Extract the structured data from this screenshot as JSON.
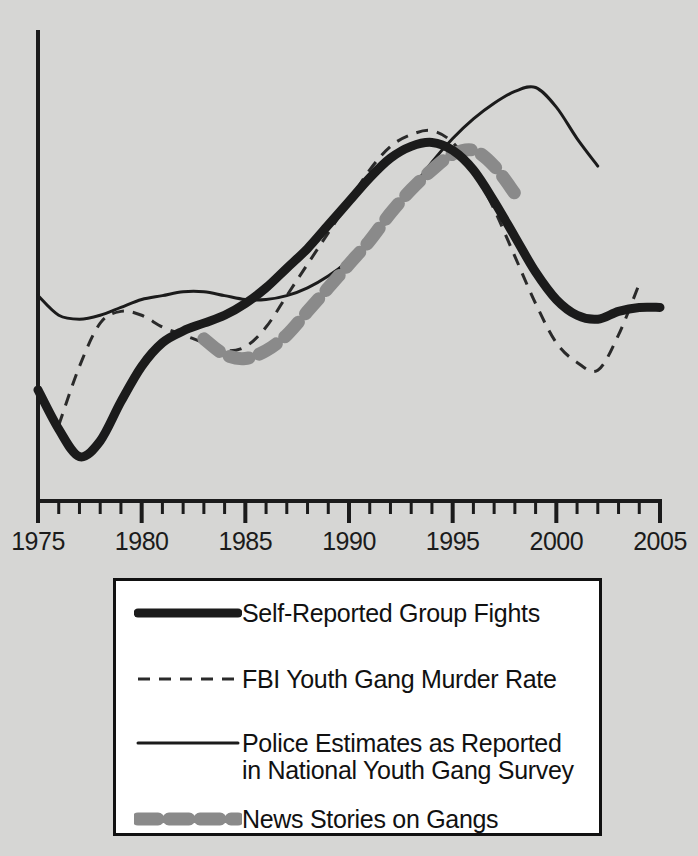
{
  "colors": {
    "background": "#d6d6d4",
    "axis": "#1b1b1b",
    "thick_black": "#1b1b1b",
    "thin_black": "#1b1b1b",
    "dashed_black": "#2a2a2a",
    "gray_dashed": "#8a8a8a",
    "legend_background": "#ffffff",
    "legend_border": "#111111"
  },
  "chart_data": {
    "type": "line",
    "title": "",
    "xlabel": "",
    "ylabel": "",
    "xlim": [
      1975,
      2005
    ],
    "ylim": [
      0,
      100
    ],
    "grid": false,
    "legend_position": "bottom",
    "x_tick_labels": [
      "1975",
      "1980",
      "1985",
      "1990",
      "1995",
      "2000",
      "2005"
    ],
    "x_major_ticks": [
      1975,
      1980,
      1985,
      1990,
      1995,
      2000,
      2005
    ],
    "x_minor_tick_interval": 1,
    "y_axis_ticks": [],
    "series": [
      {
        "name": "Self-Reported Group Fights",
        "style": "thick-solid",
        "color": "#1b1b1b",
        "x": [
          1975,
          1976,
          1977,
          1978,
          1979,
          1980,
          1981,
          1982,
          1983,
          1984,
          1985,
          1986,
          1987,
          1988,
          1989,
          1990,
          1991,
          1992,
          1993,
          1994,
          1995,
          1996,
          1997,
          1998,
          1999,
          2000,
          2001,
          2002,
          2003,
          2004,
          2005
        ],
        "values": [
          26,
          16,
          9,
          13,
          23,
          32,
          38,
          41,
          43,
          45,
          48,
          52,
          57,
          62,
          68,
          74,
          80,
          85,
          88,
          89,
          87,
          82,
          74,
          65,
          56,
          49,
          45,
          44,
          46,
          47,
          47
        ]
      },
      {
        "name": "FBI Youth Gang Murder Rate",
        "style": "thin-dashed",
        "color": "#2a2a2a",
        "x": [
          1976,
          1977,
          1978,
          1979,
          1980,
          1981,
          1982,
          1983,
          1984,
          1985,
          1986,
          1987,
          1988,
          1989,
          1990,
          1991,
          1992,
          1993,
          1994,
          1995,
          1996,
          1997,
          1998,
          1999,
          2000,
          2001,
          2002,
          2003,
          2004
        ],
        "values": [
          17,
          32,
          43,
          46,
          45,
          42,
          40,
          38,
          36,
          37,
          42,
          50,
          58,
          66,
          74,
          82,
          88,
          91,
          92,
          89,
          82,
          72,
          60,
          48,
          38,
          33,
          31,
          40,
          53
        ]
      },
      {
        "name": "Police Estimates as Reported in National Youth Gang Survey",
        "style": "thin-solid",
        "color": "#1b1b1b",
        "x": [
          1975,
          1976,
          1977,
          1978,
          1979,
          1980,
          1981,
          1982,
          1983,
          1984,
          1985,
          1986,
          1987,
          1988,
          1989,
          1990,
          1991,
          1992,
          1993,
          1994,
          1995,
          1996,
          1997,
          1998,
          1999,
          2000,
          2001,
          2002
        ],
        "values": [
          50,
          45,
          44,
          45,
          47,
          49,
          50,
          51,
          51,
          50,
          49,
          49,
          50,
          52,
          55,
          59,
          64,
          70,
          77,
          84,
          90,
          95,
          99,
          102,
          103,
          98,
          90,
          83
        ]
      },
      {
        "name": "News Stories on Gangs",
        "style": "thick-gray-dashed",
        "color": "#8a8a8a",
        "x": [
          1983,
          1984,
          1985,
          1986,
          1987,
          1988,
          1989,
          1990,
          1991,
          1992,
          1993,
          1994,
          1995,
          1996,
          1997,
          1998
        ],
        "values": [
          39,
          35,
          34,
          36,
          40,
          46,
          52,
          58,
          64,
          71,
          77,
          82,
          86,
          87,
          83,
          76
        ]
      }
    ]
  },
  "legend": {
    "items": [
      {
        "label": "Self-Reported Group Fights",
        "label_line2": "",
        "style": "thick-solid"
      },
      {
        "label": "FBI Youth Gang Murder Rate",
        "label_line2": "",
        "style": "thin-dashed"
      },
      {
        "label": "Police Estimates as Reported",
        "label_line2": "in National Youth Gang Survey",
        "style": "thin-solid"
      },
      {
        "label": "News Stories on Gangs",
        "label_line2": "",
        "style": "thick-gray-dashed"
      }
    ]
  }
}
